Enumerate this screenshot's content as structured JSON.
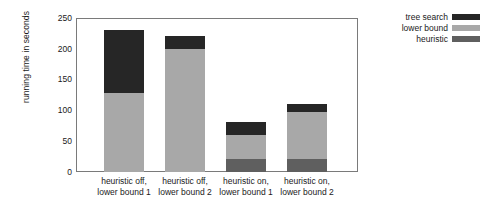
{
  "chart_data": {
    "type": "bar",
    "title": "",
    "subtitle": "",
    "xlabel": "",
    "ylabel": "running time in seconds",
    "ylim": [
      0,
      250
    ],
    "yticks": [
      0,
      50,
      100,
      150,
      200,
      250
    ],
    "grid": false,
    "stacked": true,
    "legend_position": "top-right",
    "categories": [
      "heuristic off,\nlower bound 1",
      "heuristic off,\nlower bound 2",
      "heuristic on,\nlower bound 1",
      "heuristic on,\nlower bound 2"
    ],
    "category_lines": [
      [
        "heuristic off,",
        "lower bound 1"
      ],
      [
        "heuristic off,",
        "lower bound 2"
      ],
      [
        "heuristic on,",
        "lower bound 1"
      ],
      [
        "heuristic on,",
        "lower bound 2"
      ]
    ],
    "series": [
      {
        "name": "heuristic",
        "color": "#5f5f5f",
        "values": [
          0,
          0,
          21,
          21
        ]
      },
      {
        "name": "lower bound",
        "color": "#a8a8a8",
        "values": [
          129,
          200,
          39,
          76
        ]
      },
      {
        "name": "tree search",
        "color": "#262626",
        "values": [
          101,
          21,
          21,
          13
        ]
      }
    ],
    "totals": [
      230,
      221,
      81,
      110
    ],
    "legend_entries": [
      {
        "label": "tree search",
        "color": "#262626"
      },
      {
        "label": "lower bound",
        "color": "#a8a8a8"
      },
      {
        "label": "heuristic",
        "color": "#5f5f5f"
      }
    ],
    "axis": {
      "line_color": "#7a7a7a",
      "frame": true
    }
  }
}
